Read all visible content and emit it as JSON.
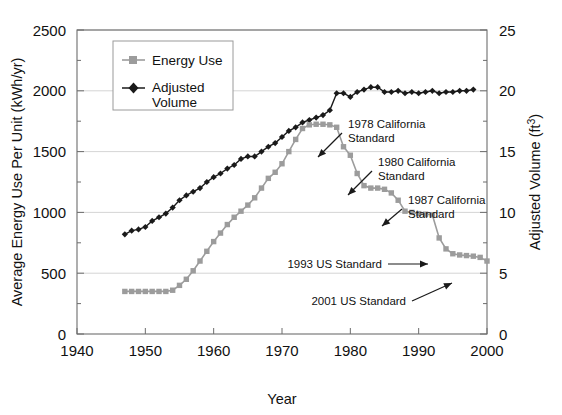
{
  "chart_data": {
    "type": "line",
    "title": "",
    "xlabel": "Year",
    "ylabel": "Average Energy Use Per Unit (kWh/yr)",
    "y2label": "Adjusted Volume (ft³)",
    "xlim": [
      1940,
      2000
    ],
    "ylim": [
      0,
      2500
    ],
    "y2lim": [
      0,
      25
    ],
    "xticks": [
      1940,
      1950,
      1960,
      1970,
      1980,
      1990,
      2000
    ],
    "yticks": [
      0,
      500,
      1000,
      1500,
      2000,
      2500
    ],
    "y2ticks": [
      0,
      5,
      10,
      15,
      20,
      25
    ],
    "grid": "horizontal",
    "legend_position": "upper-left-inside",
    "series": [
      {
        "name": "Energy Use",
        "axis": "left",
        "units": "kWh/yr",
        "marker": "square",
        "color": "#9c9c9c",
        "x": [
          1947,
          1948,
          1949,
          1950,
          1951,
          1952,
          1953,
          1954,
          1955,
          1956,
          1957,
          1958,
          1959,
          1960,
          1961,
          1962,
          1963,
          1964,
          1965,
          1966,
          1967,
          1968,
          1969,
          1970,
          1971,
          1972,
          1973,
          1974,
          1975,
          1976,
          1977,
          1978,
          1979,
          1980,
          1981,
          1982,
          1983,
          1984,
          1985,
          1986,
          1987,
          1988,
          1989,
          1990,
          1991,
          1992,
          1993,
          1994,
          1995,
          1996,
          1997,
          1998,
          1999,
          2000
        ],
        "values": [
          350,
          350,
          350,
          350,
          350,
          350,
          350,
          360,
          400,
          450,
          520,
          600,
          680,
          760,
          830,
          900,
          960,
          1010,
          1060,
          1120,
          1200,
          1280,
          1330,
          1400,
          1500,
          1600,
          1690,
          1720,
          1725,
          1725,
          1720,
          1700,
          1540,
          1470,
          1320,
          1220,
          1200,
          1200,
          1190,
          1160,
          1100,
          1010,
          1000,
          990,
          985,
          980,
          790,
          700,
          660,
          650,
          645,
          640,
          630,
          600
        ]
      },
      {
        "name": "Adjusted Volume",
        "axis": "right",
        "units": "ft³",
        "marker": "diamond",
        "color": "#1a1a1a",
        "x": [
          1947,
          1948,
          1949,
          1950,
          1951,
          1952,
          1953,
          1954,
          1955,
          1956,
          1957,
          1958,
          1959,
          1960,
          1961,
          1962,
          1963,
          1964,
          1965,
          1966,
          1967,
          1968,
          1969,
          1970,
          1971,
          1972,
          1973,
          1974,
          1975,
          1976,
          1977,
          1978,
          1979,
          1980,
          1981,
          1982,
          1983,
          1984,
          1985,
          1986,
          1987,
          1988,
          1989,
          1990,
          1991,
          1992,
          1993,
          1994,
          1995,
          1996,
          1997,
          1998
        ],
        "values_ft3": [
          8.2,
          8.5,
          8.6,
          8.8,
          9.3,
          9.6,
          9.9,
          10.4,
          11.0,
          11.4,
          11.7,
          12.0,
          12.5,
          12.9,
          13.2,
          13.6,
          13.9,
          14.4,
          14.6,
          14.6,
          15.0,
          15.4,
          15.7,
          16.2,
          16.7,
          17.0,
          17.4,
          17.6,
          17.8,
          18.0,
          18.4,
          19.8,
          19.8,
          19.5,
          19.9,
          20.1,
          20.3,
          20.3,
          19.9,
          19.9,
          20.0,
          19.8,
          19.9,
          19.8,
          19.9,
          20.0,
          19.8,
          19.9,
          19.9,
          20.0,
          20.0,
          20.1
        ]
      }
    ],
    "annotations": [
      {
        "id": "ca-1978",
        "text_line1": "1978 California",
        "text_line2": "Standard",
        "points_to_year": 1979,
        "points_to_value": 1470
      },
      {
        "id": "ca-1980",
        "text_line1": "1980 California",
        "text_line2": "Standard",
        "points_to_year": 1982,
        "points_to_value": 1220
      },
      {
        "id": "ca-1987",
        "text_line1": "1987 California",
        "text_line2": "Standard",
        "points_to_year": 1988,
        "points_to_value": 1010
      },
      {
        "id": "us-1993",
        "text_line1": "1993 US Standard",
        "text_line2": "",
        "points_to_year": 1993,
        "points_to_value": 790
      },
      {
        "id": "us-2001",
        "text_line1": "2001 US Standard",
        "text_line2": "",
        "points_to_year": 2001,
        "points_to_value": 430
      }
    ]
  },
  "axes": {
    "left_title": "Average Energy Use Per Unit (kWh/yr)",
    "right_title_pre": "Adjusted Volume (ft",
    "right_title_sup": "3",
    "right_title_post": ")",
    "x_title": "Year",
    "x_tick_labels": [
      "1940",
      "1950",
      "1960",
      "1970",
      "1980",
      "1990",
      "2000"
    ],
    "y_tick_labels": [
      "2500",
      "2000",
      "1500",
      "1000",
      "500",
      "0"
    ],
    "y2_tick_labels": [
      "25",
      "20",
      "15",
      "10",
      "5",
      "0"
    ]
  },
  "legend": {
    "items": [
      {
        "label": "Energy Use",
        "label_line2": "",
        "marker": "square",
        "color": "#9c9c9c"
      },
      {
        "label": "Adjusted",
        "label_line2": "Volume",
        "marker": "diamond",
        "color": "#1a1a1a"
      }
    ]
  },
  "annotation_labels": {
    "a0_l1": "1978 California",
    "a0_l2": "Standard",
    "a1_l1": "1980 California",
    "a1_l2": "Standard",
    "a2_l1": "1987 California",
    "a2_l2": "Standard",
    "a3_l1": "1993 US Standard",
    "a4_l1": "2001 US Standard"
  },
  "colors": {
    "energy_use": "#9c9c9c",
    "adjusted_volume": "#1a1a1a",
    "grid": "#c9c9c9",
    "frame": "#6d6d6d",
    "background": "#ffffff"
  }
}
